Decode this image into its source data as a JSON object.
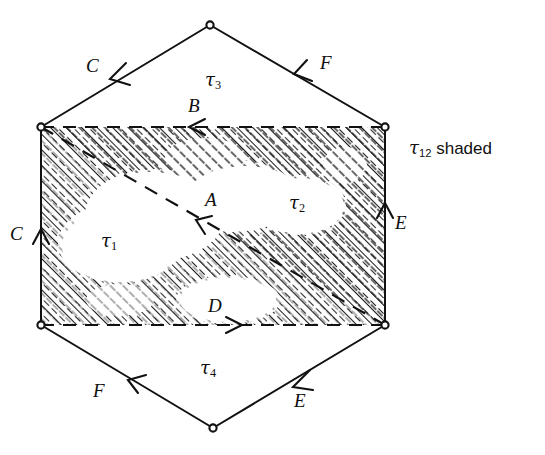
{
  "figure": {
    "ink_color": "#111111",
    "background_color": "#ffffff",
    "hatch_color": "#1a1a1a",
    "vertices": [
      {
        "name": "top",
        "x": 210,
        "y": 25
      },
      {
        "name": "upper-left",
        "x": 41,
        "y": 127
      },
      {
        "name": "upper-right",
        "x": 385,
        "y": 127
      },
      {
        "name": "lower-left",
        "x": 41,
        "y": 325
      },
      {
        "name": "lower-right",
        "x": 385,
        "y": 325
      },
      {
        "name": "bottom",
        "x": 213,
        "y": 428
      }
    ],
    "rectangle": {
      "left": 41,
      "top": 127,
      "right": 385,
      "bottom": 325
    },
    "diagonal": {
      "x1": 41,
      "y1": 127,
      "x2": 385,
      "y2": 325,
      "style": "dashed"
    },
    "edge_arrows": [
      {
        "label": "C",
        "edge": "hexagon-upper-left",
        "direction": "down-left"
      },
      {
        "label": "F",
        "edge": "hexagon-upper-right",
        "direction": "up-left"
      },
      {
        "label": "C",
        "edge": "rectangle-left",
        "direction": "up"
      },
      {
        "label": "E",
        "edge": "rectangle-right",
        "direction": "up"
      },
      {
        "label": "B",
        "edge": "rectangle-top",
        "direction": "left"
      },
      {
        "label": "D",
        "edge": "rectangle-bottom",
        "direction": "right"
      },
      {
        "label": "A",
        "edge": "diagonal",
        "direction": "up-left"
      },
      {
        "label": "F",
        "edge": "hexagon-lower-left",
        "direction": "up-left"
      },
      {
        "label": "E",
        "edge": "hexagon-lower-right",
        "direction": "down-left"
      }
    ],
    "labels": {
      "edge_c_top": "C",
      "edge_f_top": "F",
      "edge_b": "B",
      "edge_a": "A",
      "edge_c_left": "C",
      "edge_e_right": "E",
      "edge_d": "D",
      "edge_f_bottom": "F",
      "edge_e_bottom": "E"
    },
    "regions": [
      {
        "key": "tau1",
        "tau": "τ",
        "sub": "1",
        "x": 110,
        "y": 240
      },
      {
        "key": "tau2",
        "tau": "τ",
        "sub": "2",
        "x": 298,
        "y": 202
      },
      {
        "key": "tau3",
        "tau": "τ",
        "sub": "3",
        "x": 213,
        "y": 79
      },
      {
        "key": "tau4",
        "tau": "τ",
        "sub": "4",
        "x": 208,
        "y": 367
      }
    ],
    "caption": {
      "tau": "τ",
      "sub": "12",
      "text": "shaded"
    }
  }
}
